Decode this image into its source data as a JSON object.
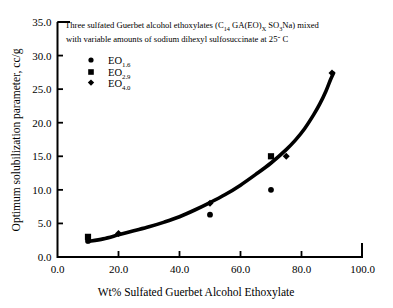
{
  "chart_data": {
    "type": "scatter",
    "title": "",
    "annotation_line1": "Three sulfated Guerbet alcohol ethoxylates (C",
    "annotation_line1_sub1": "14",
    "annotation_line1_mid": " GA(EO)",
    "annotation_line1_sub2": "X",
    "annotation_line1_mid2": " SO",
    "annotation_line1_sub3": "3",
    "annotation_line1_end": "Na) mixed",
    "annotation_line2": "with variable amounts of sodium dihexyl sulfosuccinate at 25˘ C",
    "xlabel": "Wt% Sulfated Guerbet Alcohol Ethoxylate",
    "ylabel": "Optimum solubilization parameter, cc/g",
    "xlim": [
      0.0,
      100.0
    ],
    "ylim": [
      0.0,
      35.0
    ],
    "xticks": [
      "0.0",
      "20.0",
      "40.0",
      "60.0",
      "80.0",
      "100.0"
    ],
    "xtick_values": [
      0,
      20,
      40,
      60,
      80,
      100
    ],
    "yticks": [
      "0.0",
      "5.0",
      "10.0",
      "15.0",
      "20.0",
      "25.0",
      "30.0",
      "35.0"
    ],
    "ytick_values": [
      0,
      5,
      10,
      15,
      20,
      25,
      30,
      35
    ],
    "grid": false,
    "legend_position": "upper-left-inside",
    "marker_color": "#000000",
    "curve_color": "#000000",
    "series": [
      {
        "name": "EO",
        "subscript": "1.6",
        "marker": "circle",
        "points": [
          {
            "x": 10,
            "y": 2.4
          },
          {
            "x": 50,
            "y": 6.3
          },
          {
            "x": 70,
            "y": 10.0
          }
        ]
      },
      {
        "name": "EO",
        "subscript": "2.9",
        "marker": "square",
        "points": [
          {
            "x": 10,
            "y": 3.0
          },
          {
            "x": 70,
            "y": 15.0
          }
        ]
      },
      {
        "name": "EO",
        "subscript": "4.0",
        "marker": "diamond",
        "points": [
          {
            "x": 20,
            "y": 3.5
          },
          {
            "x": 50,
            "y": 8.0
          },
          {
            "x": 75,
            "y": 15.0
          },
          {
            "x": 90,
            "y": 27.4
          }
        ]
      }
    ],
    "fit_curve": {
      "label": "fitted trend",
      "points": [
        {
          "x": 10,
          "y": 2.3
        },
        {
          "x": 15,
          "y": 2.7
        },
        {
          "x": 20,
          "y": 3.3
        },
        {
          "x": 25,
          "y": 3.9
        },
        {
          "x": 30,
          "y": 4.5
        },
        {
          "x": 35,
          "y": 5.2
        },
        {
          "x": 40,
          "y": 6.0
        },
        {
          "x": 45,
          "y": 7.0
        },
        {
          "x": 50,
          "y": 8.1
        },
        {
          "x": 55,
          "y": 9.3
        },
        {
          "x": 60,
          "y": 10.7
        },
        {
          "x": 65,
          "y": 12.3
        },
        {
          "x": 70,
          "y": 14.0
        },
        {
          "x": 75,
          "y": 16.0
        },
        {
          "x": 78,
          "y": 17.4
        },
        {
          "x": 81,
          "y": 19.1
        },
        {
          "x": 84,
          "y": 21.2
        },
        {
          "x": 86,
          "y": 22.8
        },
        {
          "x": 88,
          "y": 24.7
        },
        {
          "x": 89.5,
          "y": 26.4
        },
        {
          "x": 90.5,
          "y": 27.4
        }
      ]
    }
  },
  "legend": {
    "entries": [
      {
        "label": "EO",
        "sub": "1.6",
        "marker": "circle"
      },
      {
        "label": "EO",
        "sub": "2.9",
        "marker": "square"
      },
      {
        "label": "EO",
        "sub": "4.0",
        "marker": "diamond"
      }
    ]
  }
}
